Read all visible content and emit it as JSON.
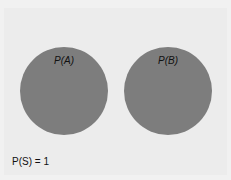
{
  "diagram": {
    "type": "venn",
    "events": [
      {
        "label": "P(A)",
        "color": "#7d7d7d"
      },
      {
        "label": "P(B)",
        "color": "#7d7d7d"
      }
    ],
    "sample_space_label": "P(S) = 1",
    "background": "#ececec"
  }
}
